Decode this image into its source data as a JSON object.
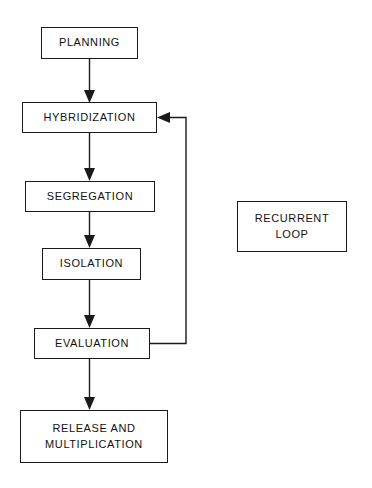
{
  "diagram": {
    "type": "flowchart",
    "canvas": {
      "width": 372,
      "height": 488,
      "background": "#ffffff"
    },
    "line_color": "#1a1a1a",
    "text_color": "#111111",
    "nodes": [
      {
        "id": "planning",
        "label": "PLANNING",
        "shape": "rectangle",
        "x": 41,
        "y": 27,
        "width": 97,
        "height": 32
      },
      {
        "id": "hybridization",
        "label": "HYBRIDIZATION",
        "shape": "rectangle",
        "x": 22,
        "y": 102,
        "width": 135,
        "height": 31
      },
      {
        "id": "segregation",
        "label": "SEGREGATION",
        "shape": "rectangle",
        "x": 25,
        "y": 181,
        "width": 130,
        "height": 31
      },
      {
        "id": "isolation",
        "label": "ISOLATION",
        "shape": "rectangle",
        "x": 42,
        "y": 248,
        "width": 99,
        "height": 32
      },
      {
        "id": "evaluation",
        "label": "EVALUATION",
        "shape": "rectangle",
        "x": 34,
        "y": 328,
        "width": 116,
        "height": 31
      },
      {
        "id": "release-and-multiplication",
        "label": "RELEASE AND\nMULTIPLICATION",
        "shape": "rectangle",
        "x": 20,
        "y": 410,
        "width": 148,
        "height": 53
      },
      {
        "id": "recurrent-loop",
        "label": "RECURRENT\nLOOP",
        "shape": "rectangle",
        "x": 237,
        "y": 201,
        "width": 110,
        "height": 51
      }
    ],
    "edges": [
      {
        "id": "planning-to-hybridization",
        "from": "planning",
        "to": "hybridization",
        "kind": "straight-down",
        "arrow": true
      },
      {
        "id": "hybridization-to-segregation",
        "from": "hybridization",
        "to": "segregation",
        "kind": "straight-down",
        "arrow": true
      },
      {
        "id": "segregation-to-isolation",
        "from": "segregation",
        "to": "isolation",
        "kind": "straight-down",
        "arrow": true
      },
      {
        "id": "isolation-to-evaluation",
        "from": "isolation",
        "to": "evaluation",
        "kind": "straight-down",
        "arrow": true
      },
      {
        "id": "evaluation-to-release",
        "from": "evaluation",
        "to": "release-and-multiplication",
        "kind": "straight-down",
        "arrow": true
      },
      {
        "id": "evaluation-to-hybridization-feedback",
        "from": "evaluation",
        "to": "hybridization",
        "kind": "recurrent-feedback",
        "arrow": true
      }
    ],
    "legend_note": "RECURRENT LOOP"
  }
}
